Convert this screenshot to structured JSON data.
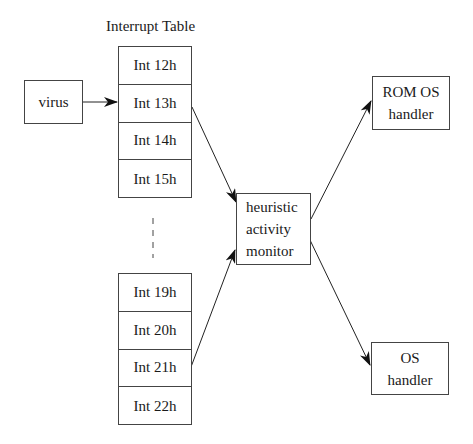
{
  "diagram": {
    "title": "Interrupt Table",
    "virus": {
      "label": "virus"
    },
    "table_top": {
      "rows": [
        "Int 12h",
        "Int 13h",
        "Int 14h",
        "Int 15h"
      ]
    },
    "table_bottom": {
      "rows": [
        "Int 19h",
        "Int 20h",
        "Int 21h",
        "Int 22h"
      ]
    },
    "monitor": {
      "lines": [
        "heuristic",
        "activity",
        "monitor"
      ]
    },
    "rom_handler": {
      "lines": [
        "ROM OS",
        "handler"
      ]
    },
    "os_handler": {
      "lines": [
        "OS",
        "handler"
      ]
    },
    "edges": [
      {
        "from": "virus",
        "to": "Int 13h"
      },
      {
        "from": "Int 13h",
        "to": "heuristic activity monitor"
      },
      {
        "from": "Int 21h",
        "to": "heuristic activity monitor"
      },
      {
        "from": "heuristic activity monitor",
        "to": "ROM OS handler"
      },
      {
        "from": "heuristic activity monitor",
        "to": "OS handler"
      }
    ]
  }
}
